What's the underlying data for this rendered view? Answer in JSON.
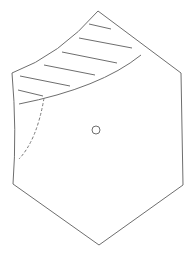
{
  "diagram": {
    "colors": {
      "background": "#ffffff",
      "stroke": "#6e6e6e",
      "hatch": "#6e6e6e",
      "dashed": "#7a7a7a",
      "circle": "#6e6e6e"
    },
    "hexagon": {
      "vertices": [
        {
          "name": "top",
          "x": 98,
          "y": 11
        },
        {
          "name": "upper-right",
          "x": 181,
          "y": 73
        },
        {
          "name": "lower-right",
          "x": 183,
          "y": 185
        },
        {
          "name": "bottom",
          "x": 99,
          "y": 245
        },
        {
          "name": "lower-left",
          "x": 13,
          "y": 184
        },
        {
          "name": "upper-left",
          "x": 12,
          "y": 73
        }
      ]
    },
    "hatched_region": {
      "hatch_line_count": 6
    },
    "center_circle": {
      "cx": 96,
      "cy": 130,
      "r": 4
    }
  }
}
